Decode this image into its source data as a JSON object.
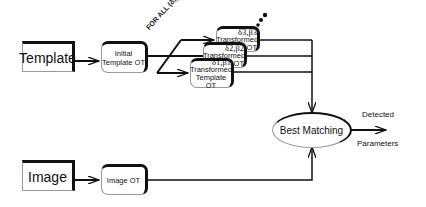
{
  "diagram": {
    "inputs": {
      "template": "Template",
      "image": "Image"
    },
    "initial_template_ot": {
      "line1": "Initial",
      "line2": "Template OT"
    },
    "image_ot": "Image OT",
    "for_all_label": "FOR ALL (δ,β)",
    "transformed": [
      {
        "params": "δ1,β1",
        "line1": "Transformed",
        "line2": "Template OT"
      },
      {
        "params": "δ2,β2",
        "line1": "Transformed",
        "line2": "OT"
      },
      {
        "params": "δ3,β3",
        "line1": "Transformed",
        "line2": "OT"
      }
    ],
    "best_matching": "Best Matching",
    "output": {
      "line1": "Detected",
      "line2": "Parameters"
    }
  }
}
